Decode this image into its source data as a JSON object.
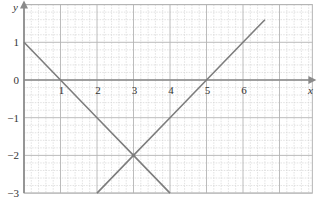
{
  "chart_data": {
    "type": "line",
    "title": "",
    "xlabel": "x",
    "ylabel": "y",
    "xlim": [
      0,
      7.9
    ],
    "ylim": [
      -3,
      2
    ],
    "grid": true,
    "minor_grid_per_unit": 5,
    "x_ticks": [
      1,
      2,
      3,
      4,
      5,
      6
    ],
    "x_tick_labels": [
      "1",
      "2",
      "3",
      "4",
      "5",
      "6"
    ],
    "y_ticks": [
      1,
      0,
      -1,
      -2,
      -3
    ],
    "y_tick_labels": [
      "1",
      "0",
      "−1",
      "−2",
      "−3"
    ],
    "series": [
      {
        "name": "y = 1 − x",
        "points": [
          [
            0,
            1
          ],
          [
            1,
            0
          ],
          [
            2,
            -1
          ],
          [
            3,
            -2
          ],
          [
            4,
            -3
          ]
        ]
      },
      {
        "name": "y = x − 5",
        "points": [
          [
            2,
            -3
          ],
          [
            3,
            -2
          ],
          [
            4,
            -1
          ],
          [
            5,
            0
          ],
          [
            6,
            1
          ],
          [
            6.6,
            1.6
          ]
        ]
      }
    ],
    "annotations": [
      {
        "type": "intersection",
        "point": [
          3,
          -2
        ]
      }
    ]
  },
  "colors": {
    "major_grid": "#b4b4b4",
    "minor_grid": "#cfcfcf",
    "axis": "#8a8a8a",
    "line": "#7d7d7d"
  }
}
